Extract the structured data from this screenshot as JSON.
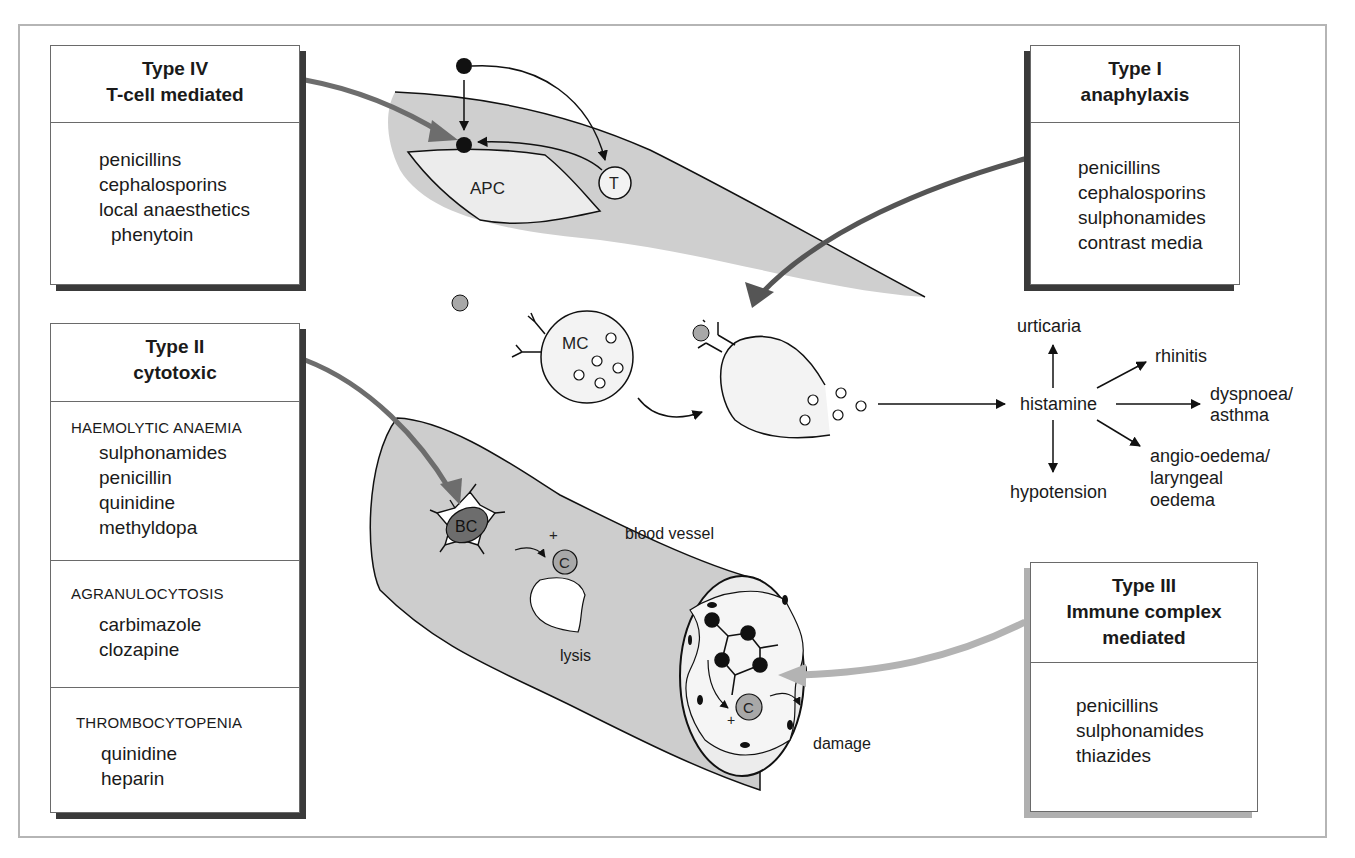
{
  "type_iv": {
    "title": "Type IV",
    "subtitle": "T-cell mediated",
    "drugs": [
      "penicillins",
      "cephalosporins",
      "local anaesthetics",
      "phenytoin"
    ]
  },
  "type_i": {
    "title": "Type I",
    "subtitle": "anaphylaxis",
    "drugs": [
      "penicillins",
      "cephalosporins",
      "sulphonamides",
      "contrast media"
    ]
  },
  "type_ii": {
    "title": "Type II",
    "subtitle": "cytotoxic",
    "sections": [
      {
        "heading": "HAEMOLYTIC ANAEMIA",
        "drugs": [
          "sulphonamides",
          "penicillin",
          "quinidine",
          "methyldopa"
        ]
      },
      {
        "heading": "AGRANULOCYTOSIS",
        "drugs": [
          "carbimazole",
          "clozapine"
        ]
      },
      {
        "heading": "THROMBOCYTOPENIA",
        "drugs": [
          "quinidine",
          "heparin"
        ]
      }
    ]
  },
  "type_iii": {
    "title": "Type III",
    "subtitle1": "Immune complex",
    "subtitle2": "mediated",
    "drugs": [
      "penicillins",
      "sulphonamides",
      "thiazides"
    ]
  },
  "diagram": {
    "apc_label": "APC",
    "t_cell_label": "T",
    "mast_cell_label": "MC",
    "histamine_label": "histamine",
    "effects": {
      "urticaria": "urticaria",
      "rhinitis": "rhinitis",
      "dyspnoea_1": "dyspnoea/",
      "dyspnoea_2": "asthma",
      "angio_1": "angio-oedema/",
      "angio_2": "laryngeal",
      "angio_3": "oedema",
      "hypotension": "hypotension"
    },
    "bc_label": "BC",
    "complement_label": "C",
    "plus": "+",
    "blood_vessel_label": "blood vessel",
    "lysis_label": "lysis",
    "damage_label": "damage"
  },
  "colors": {
    "shade_light": "#d9d9d9",
    "shade_mid": "#a8a8a8",
    "shade_dark": "#6d6d6d",
    "arrow_dark": "#5a5a5a",
    "arrow_light": "#b3b3b3",
    "outline": "#111111"
  }
}
